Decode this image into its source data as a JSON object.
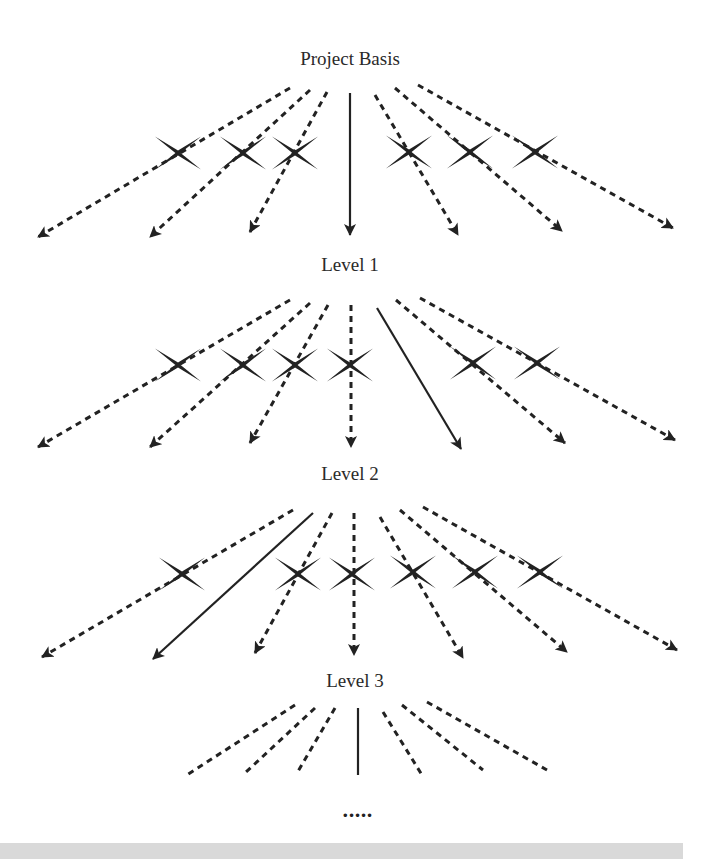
{
  "diagram": {
    "title": "Project Basis",
    "levels": [
      "Level 1",
      "Level 2",
      "Level 3"
    ],
    "continuation": "•••••",
    "colors": {
      "ink": "#222222",
      "label": "#2a2a2a",
      "bar": "#d9d9d9"
    },
    "legend_semantics": {
      "solid_arrow": "selected path",
      "dashed_arrow": "alternative path",
      "cross": "rejected alternative"
    },
    "stages": [
      {
        "from": "Project Basis",
        "to": "Level 1",
        "arrows": [
          {
            "x1": 290,
            "y1": 88,
            "x2": 38,
            "y2": 237,
            "style": "dashed"
          },
          {
            "x1": 310,
            "y1": 90,
            "x2": 150,
            "y2": 237,
            "style": "dashed"
          },
          {
            "x1": 327,
            "y1": 92,
            "x2": 250,
            "y2": 232,
            "style": "dashed"
          },
          {
            "x1": 350,
            "y1": 93,
            "x2": 350,
            "y2": 235,
            "style": "solid"
          },
          {
            "x1": 375,
            "y1": 95,
            "x2": 458,
            "y2": 235,
            "style": "dashed"
          },
          {
            "x1": 395,
            "y1": 88,
            "x2": 562,
            "y2": 231,
            "style": "dashed"
          },
          {
            "x1": 418,
            "y1": 85,
            "x2": 673,
            "y2": 228,
            "style": "dashed"
          }
        ],
        "crosses": [
          [
            178,
            153
          ],
          [
            243,
            153
          ],
          [
            295,
            153
          ],
          [
            409,
            152
          ],
          [
            470,
            152
          ],
          [
            535,
            152
          ]
        ]
      },
      {
        "from": "Level 1",
        "to": "Level 2",
        "arrows": [
          {
            "x1": 290,
            "y1": 300,
            "x2": 38,
            "y2": 447,
            "style": "dashed"
          },
          {
            "x1": 310,
            "y1": 303,
            "x2": 150,
            "y2": 447,
            "style": "dashed"
          },
          {
            "x1": 328,
            "y1": 305,
            "x2": 250,
            "y2": 443,
            "style": "dashed"
          },
          {
            "x1": 351,
            "y1": 305,
            "x2": 351,
            "y2": 447,
            "style": "dashed"
          },
          {
            "x1": 377,
            "y1": 308,
            "x2": 461,
            "y2": 449,
            "style": "solid"
          },
          {
            "x1": 396,
            "y1": 300,
            "x2": 565,
            "y2": 443,
            "style": "dashed"
          },
          {
            "x1": 420,
            "y1": 298,
            "x2": 675,
            "y2": 440,
            "style": "dashed"
          }
        ],
        "crosses": [
          [
            178,
            365
          ],
          [
            243,
            365
          ],
          [
            295,
            365
          ],
          [
            350,
            365
          ],
          [
            473,
            363
          ],
          [
            537,
            363
          ]
        ]
      },
      {
        "from": "Level 2",
        "to": "Level 3",
        "arrows": [
          {
            "x1": 293,
            "y1": 510,
            "x2": 42,
            "y2": 657,
            "style": "dashed"
          },
          {
            "x1": 313,
            "y1": 513,
            "x2": 153,
            "y2": 659,
            "style": "solid"
          },
          {
            "x1": 332,
            "y1": 513,
            "x2": 255,
            "y2": 653,
            "style": "dashed"
          },
          {
            "x1": 354,
            "y1": 513,
            "x2": 354,
            "y2": 655,
            "style": "dashed"
          },
          {
            "x1": 380,
            "y1": 517,
            "x2": 463,
            "y2": 658,
            "style": "dashed"
          },
          {
            "x1": 400,
            "y1": 510,
            "x2": 567,
            "y2": 652,
            "style": "dashed"
          },
          {
            "x1": 423,
            "y1": 507,
            "x2": 677,
            "y2": 650,
            "style": "dashed"
          }
        ],
        "crosses": [
          [
            182,
            574
          ],
          [
            298,
            574
          ],
          [
            352,
            574
          ],
          [
            413,
            572
          ],
          [
            475,
            572
          ],
          [
            540,
            572
          ]
        ]
      }
    ],
    "trailing_lines": [
      {
        "x1": 295,
        "y1": 705,
        "x2": 187,
        "y2": 775,
        "style": "dashed"
      },
      {
        "x1": 315,
        "y1": 708,
        "x2": 245,
        "y2": 773,
        "style": "dashed"
      },
      {
        "x1": 335,
        "y1": 708,
        "x2": 297,
        "y2": 773,
        "style": "dashed"
      },
      {
        "x1": 358,
        "y1": 708,
        "x2": 358,
        "y2": 775,
        "style": "solid"
      },
      {
        "x1": 383,
        "y1": 712,
        "x2": 422,
        "y2": 775,
        "style": "dashed"
      },
      {
        "x1": 402,
        "y1": 705,
        "x2": 483,
        "y2": 770,
        "style": "dashed"
      },
      {
        "x1": 427,
        "y1": 702,
        "x2": 547,
        "y2": 770,
        "style": "dashed"
      }
    ]
  }
}
